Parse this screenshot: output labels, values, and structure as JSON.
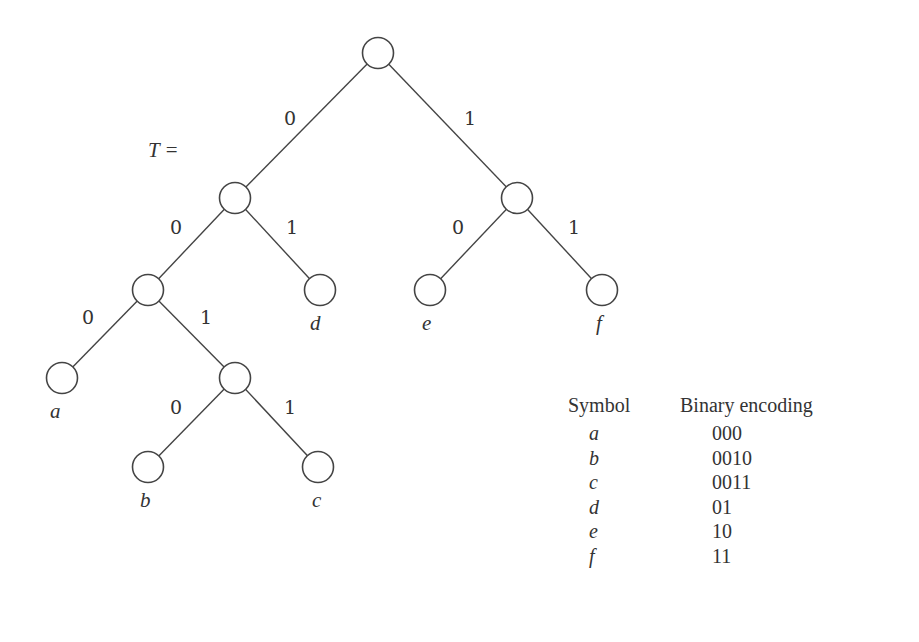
{
  "diagram": {
    "tree_label": "T =",
    "edge_labels": {
      "root_left": "0",
      "root_right": "1",
      "n1_left": "0",
      "n1_right": "1",
      "n2_left": "0",
      "n2_right": "1",
      "n3_left": "0",
      "n3_right": "1",
      "n4_left": "0",
      "n4_right": "1"
    },
    "leaf_labels": {
      "a": "a",
      "b": "b",
      "c": "c",
      "d": "d",
      "e": "e",
      "f": "f"
    }
  },
  "encoding_table": {
    "headers": [
      "Symbol",
      "Binary encoding"
    ],
    "rows": [
      {
        "symbol": "a",
        "code": "000"
      },
      {
        "symbol": "b",
        "code": "0010"
      },
      {
        "symbol": "c",
        "code": "0011"
      },
      {
        "symbol": "d",
        "code": "01"
      },
      {
        "symbol": "e",
        "code": "10"
      },
      {
        "symbol": "f",
        "code": "11"
      }
    ]
  }
}
